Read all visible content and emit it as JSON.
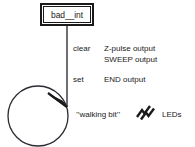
{
  "diagram": {
    "state": {
      "name": "bad__int",
      "shape": "rectangle",
      "double_border": true
    },
    "loop": {
      "shape": "circle",
      "has_arrowhead": true,
      "description": "self-loop back into state"
    },
    "annotations": [
      {
        "key": "clear",
        "values": [
          "Z-pulse output",
          "SWEEP output"
        ]
      },
      {
        "key": "set",
        "values": [
          "END output"
        ]
      }
    ],
    "footer": {
      "left_text": "’’walking bit’’",
      "symbol": "led-zigzag-icon",
      "right_text": "LEDs"
    },
    "colors": {
      "background": "#ffffff",
      "ink": "#1a1a1a",
      "line": "#4a4a52"
    }
  }
}
